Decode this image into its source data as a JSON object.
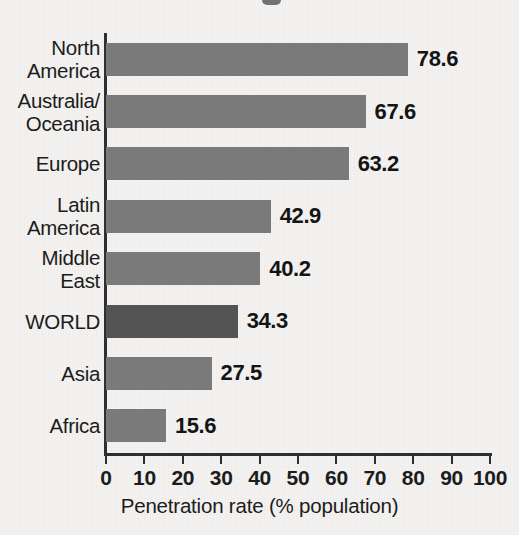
{
  "chart_data": {
    "type": "bar",
    "orientation": "horizontal",
    "title": "",
    "xlabel": "Penetration rate (% population)",
    "ylabel": "",
    "xlim": [
      0,
      100
    ],
    "xticks": [
      0,
      10,
      20,
      30,
      40,
      50,
      60,
      70,
      80,
      90,
      100
    ],
    "xtick_labels": [
      "0",
      "10",
      "20",
      "30",
      "40",
      "50",
      "60",
      "70",
      "80",
      "90",
      "100"
    ],
    "grid": false,
    "legend": null,
    "categories": [
      "North\nAmerica",
      "Australia/\nOceania",
      "Europe",
      "Latin\nAmerica",
      "Middle\nEast",
      "WORLD",
      "Asia",
      "Africa"
    ],
    "values": [
      78.6,
      67.6,
      63.2,
      42.9,
      40.2,
      34.3,
      27.5,
      15.6
    ],
    "value_labels": [
      "78.6",
      "67.6",
      "63.2",
      "42.9",
      "40.2",
      "34.3",
      "27.5",
      "15.6"
    ],
    "highlight_index": 5,
    "colors": {
      "bar": "#7b7b7b",
      "bar_highlight": "#555555",
      "axis": "#2f2f2f",
      "text": "#1c1c1c",
      "background": "#f3f2f0"
    }
  }
}
